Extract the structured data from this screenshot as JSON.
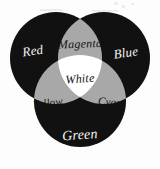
{
  "diagram": {
    "background_color": "#fdfdfd",
    "primary_circle_color": "#111111",
    "overlap_color": "#a8a8a8",
    "center_color": "#ffffff",
    "label_light_color": "#f4f4f4",
    "label_dark_color": "#141414",
    "regions": [
      {
        "id": "red",
        "label": "Red",
        "kind": "primary",
        "fill": "#111111",
        "text_color": "#f4f4f4",
        "x": 33,
        "y": 52,
        "font_size": 13,
        "rotation": -8
      },
      {
        "id": "blue",
        "label": "Blue",
        "kind": "primary",
        "fill": "#111111",
        "text_color": "#f4f4f4",
        "x": 126,
        "y": 54,
        "font_size": 13,
        "rotation": -8
      },
      {
        "id": "green",
        "label": "Green",
        "kind": "primary",
        "fill": "#111111",
        "text_color": "#f4f4f4",
        "x": 80,
        "y": 136,
        "font_size": 14,
        "rotation": -4
      },
      {
        "id": "magenta",
        "label": "Magenta",
        "kind": "overlap",
        "fill": "#a8a8a8",
        "text_color": "#141414",
        "x": 80,
        "y": 45,
        "font_size": 12,
        "rotation": -2
      },
      {
        "id": "yellow",
        "label": "Yellow",
        "kind": "overlap",
        "fill": "#a8a8a8",
        "text_color": "#141414",
        "x": 48,
        "y": 104,
        "font_size": 11,
        "rotation": -7
      },
      {
        "id": "cyan",
        "label": "Cyan",
        "kind": "overlap",
        "fill": "#a8a8a8",
        "text_color": "#141414",
        "x": 110,
        "y": 103,
        "font_size": 11,
        "rotation": 6
      },
      {
        "id": "white",
        "label": "White",
        "kind": "center",
        "fill": "#ffffff",
        "text_color": "#141414",
        "x": 80,
        "y": 80,
        "font_size": 12,
        "rotation": -4
      }
    ],
    "circles": [
      {
        "id": "circle-red",
        "cx": 56,
        "cy": 58,
        "r": 46
      },
      {
        "id": "circle-blue",
        "cx": 104,
        "cy": 58,
        "r": 46
      },
      {
        "id": "circle-green",
        "cx": 80,
        "cy": 101,
        "r": 46
      }
    ]
  }
}
